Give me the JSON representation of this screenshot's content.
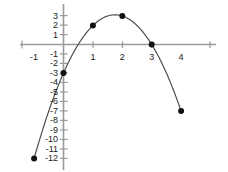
{
  "chart_data": {
    "type": "line",
    "title": "",
    "subtitle": "",
    "xlabel": "",
    "ylabel": "",
    "xlim": [
      -1.5,
      4.5
    ],
    "ylim": [
      -13,
      4
    ],
    "grid": false,
    "legend": "none",
    "equation": "y = -2x^2 + 7x - 3",
    "x": [
      -1,
      0,
      1,
      2,
      3,
      4
    ],
    "values": [
      -12,
      -3,
      2,
      3,
      0,
      -7
    ],
    "points": [
      {
        "x": -1,
        "y": -12
      },
      {
        "x": 0,
        "y": -3
      },
      {
        "x": 1,
        "y": 2
      },
      {
        "x": 2,
        "y": 3
      },
      {
        "x": 3,
        "y": 0
      },
      {
        "x": 4,
        "y": -7
      }
    ],
    "x_tick_labels": [
      "-1",
      "1",
      "2",
      "3",
      "4"
    ],
    "x_tick_values": [
      -1,
      1,
      2,
      3,
      4
    ],
    "y_tick_labels": [
      "3",
      "2",
      "1",
      "-1",
      "-2",
      "-3",
      "-4",
      "-5",
      "-6",
      "-7",
      "-8",
      "-9",
      "-10",
      "-11",
      "-12"
    ],
    "y_tick_values": [
      3,
      2,
      1,
      -1,
      -2,
      -3,
      -4,
      -5,
      -6,
      -7,
      -8,
      -9,
      -10,
      -11,
      -12
    ],
    "colors": {
      "axis": "#9a9a9a",
      "curve": "#4d4d4d",
      "point": "#111111",
      "label": "#1a1a1a",
      "background": "#ffffff"
    }
  }
}
